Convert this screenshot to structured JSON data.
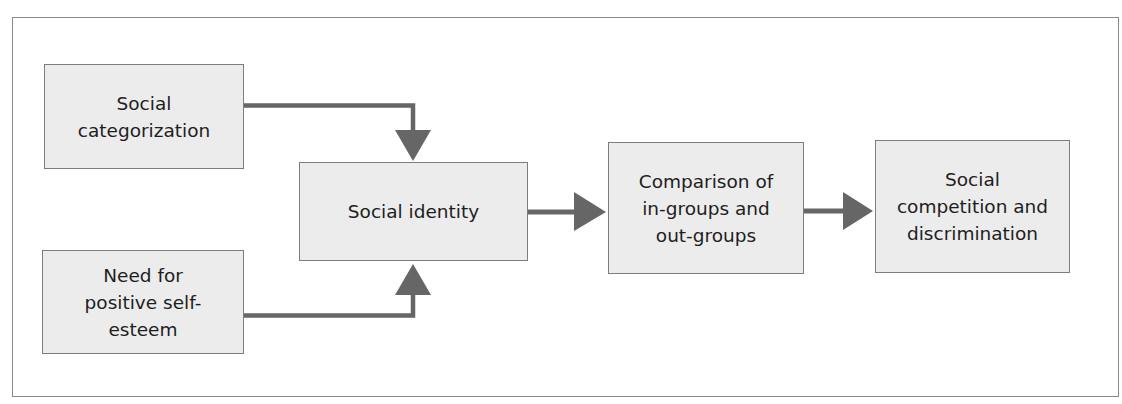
{
  "diagram": {
    "type": "flowchart",
    "nodes": [
      {
        "id": "social_categorization",
        "label": "Social\ncategorization"
      },
      {
        "id": "need_self_esteem",
        "label": "Need for\npositive self-\nesteem"
      },
      {
        "id": "social_identity",
        "label": "Social identity"
      },
      {
        "id": "comparison",
        "label": "Comparison of\nin-groups and\nout-groups"
      },
      {
        "id": "competition",
        "label": "Social\ncompetition and\ndiscrimination"
      }
    ],
    "edges": [
      {
        "from": "social_categorization",
        "to": "social_identity"
      },
      {
        "from": "need_self_esteem",
        "to": "social_identity"
      },
      {
        "from": "social_identity",
        "to": "comparison"
      },
      {
        "from": "comparison",
        "to": "competition"
      }
    ],
    "colors": {
      "box_fill": "#ececec",
      "box_border": "#7d7d7d",
      "arrow": "#666666",
      "frame": "#8a8a8a"
    }
  }
}
